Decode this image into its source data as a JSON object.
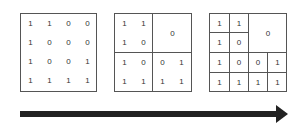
{
  "matrix_full": {
    "rows": [
      [
        "1",
        "1",
        "0",
        "0"
      ],
      [
        "1",
        "0",
        "0",
        "0"
      ],
      [
        "1",
        "0",
        "0",
        "1"
      ],
      [
        "1",
        "1",
        "1",
        "1"
      ]
    ]
  },
  "matrix_level1": {
    "top_left": [
      [
        "1",
        "1"
      ],
      [
        "1",
        "0"
      ]
    ],
    "top_right": "0",
    "bottom_left": [
      [
        "1",
        "0"
      ],
      [
        "1",
        "1"
      ]
    ],
    "bottom_right": [
      [
        "0",
        "1"
      ],
      [
        "1",
        "1"
      ]
    ]
  },
  "matrix_level2": {
    "top_left": [
      [
        "1",
        "1"
      ],
      [
        "1",
        "0"
      ]
    ],
    "top_right": "0",
    "bottom": [
      [
        "1",
        "0",
        "0",
        "1"
      ],
      [
        "1",
        "1",
        "1",
        "1"
      ]
    ]
  },
  "arrow": {
    "direction": "right",
    "color": "#222222"
  }
}
